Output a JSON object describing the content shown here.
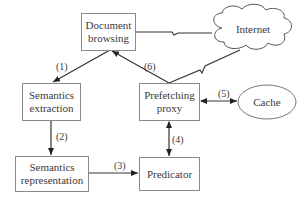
{
  "nodes": {
    "document_browsing": {
      "line1": "Document",
      "line2": "browsing"
    },
    "internet": {
      "label": "Internet"
    },
    "semantics_extraction": {
      "line1": "Semantics",
      "line2": "extraction"
    },
    "prefetching_proxy": {
      "line1": "Prefetching",
      "line2": "proxy"
    },
    "cache": {
      "label": "Cache"
    },
    "semantics_representation": {
      "line1": "Semantics",
      "line2": "representation"
    },
    "predicator": {
      "label": "Predicator"
    }
  },
  "edges": [
    {
      "id": "1",
      "label": "(1)",
      "from": "Document browsing",
      "to": "Semantics extraction"
    },
    {
      "id": "2",
      "label": "(2)",
      "from": "Semantics extraction",
      "to": "Semantics representation"
    },
    {
      "id": "3",
      "label": "(3)",
      "from": "Semantics representation",
      "to": "Predicator"
    },
    {
      "id": "4",
      "label": "(4)",
      "from": "Predicator",
      "to": "Prefetching proxy",
      "bidirectional": true
    },
    {
      "id": "5",
      "label": "(5)",
      "from": "Prefetching proxy",
      "to": "Cache",
      "bidirectional": true
    },
    {
      "id": "6",
      "label": "(6)",
      "from": "Prefetching proxy",
      "to": "Document browsing"
    }
  ],
  "links": [
    {
      "from": "Document browsing",
      "to": "Internet",
      "style": "lightning"
    },
    {
      "from": "Prefetching proxy",
      "to": "Internet",
      "style": "lightning"
    }
  ]
}
